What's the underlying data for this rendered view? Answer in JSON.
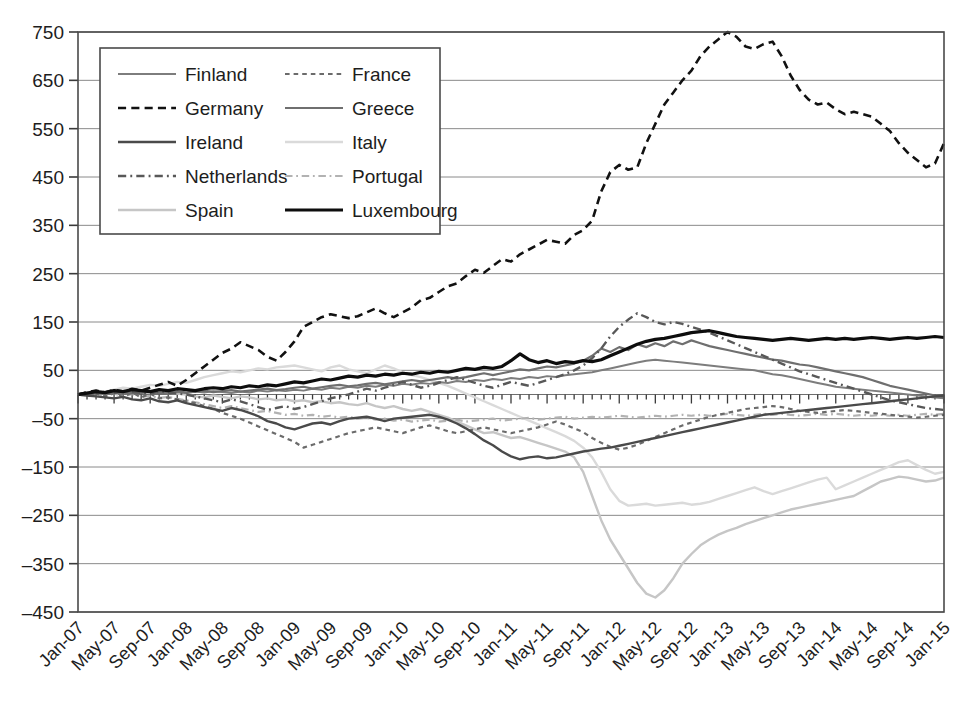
{
  "chart_data": {
    "type": "line",
    "title": "",
    "subtitle": "",
    "xlabel": "",
    "ylabel": "",
    "grid": true,
    "legend_position": "top-left-inside",
    "ylim": [
      -450,
      750
    ],
    "yticks": [
      750,
      650,
      550,
      450,
      350,
      250,
      150,
      50,
      -50,
      -150,
      -250,
      -350,
      -450
    ],
    "ytick_labels": [
      "750",
      "650",
      "550",
      "450",
      "350",
      "250",
      "150",
      "50",
      "–50",
      "–150",
      "–250",
      "–350",
      "–450"
    ],
    "x_tick_labels": [
      "Jan-07",
      "May-07",
      "Sep-07",
      "Jan-08",
      "May-08",
      "Sep-08",
      "Jan-09",
      "May-09",
      "Sep-09",
      "Jan-10",
      "May-10",
      "Sep-10",
      "Jan-11",
      "May-11",
      "Sep-11",
      "Jan-12",
      "May-12",
      "Sep-12",
      "Jan-13",
      "May-13",
      "Sep-13",
      "Jan-14",
      "May-14",
      "Sep-14",
      "Jan-15"
    ],
    "x_tick_step_months": 4,
    "x_range": [
      "Jan-07",
      "Jan-15"
    ],
    "x_points_count": 97,
    "series": [
      {
        "name": "Finland",
        "style": "solid",
        "color": "#7d7d7d",
        "width": 2.0,
        "values": [
          0,
          2,
          3,
          1,
          4,
          2,
          5,
          3,
          6,
          4,
          2,
          5,
          3,
          6,
          4,
          7,
          5,
          3,
          6,
          4,
          8,
          6,
          9,
          7,
          10,
          8,
          12,
          10,
          14,
          12,
          16,
          14,
          18,
          16,
          20,
          18,
          22,
          20,
          24,
          22,
          26,
          24,
          28,
          26,
          30,
          28,
          32,
          30,
          34,
          32,
          36,
          34,
          38,
          36,
          40,
          42,
          44,
          46,
          50,
          54,
          58,
          62,
          66,
          70,
          72,
          70,
          68,
          66,
          64,
          62,
          60,
          58,
          56,
          54,
          52,
          50,
          46,
          42,
          40,
          36,
          32,
          28,
          24,
          20,
          16,
          14,
          12,
          10,
          8,
          6,
          4,
          2,
          0,
          -2,
          -4,
          -6,
          -8
        ]
      },
      {
        "name": "Germany",
        "style": "dashed",
        "color": "#111111",
        "width": 2.6,
        "values": [
          0,
          5,
          8,
          4,
          10,
          6,
          12,
          8,
          14,
          20,
          26,
          18,
          30,
          44,
          58,
          72,
          86,
          95,
          108,
          100,
          92,
          78,
          70,
          88,
          110,
          140,
          150,
          160,
          166,
          162,
          158,
          162,
          170,
          178,
          168,
          160,
          170,
          180,
          195,
          200,
          212,
          224,
          230,
          245,
          258,
          252,
          266,
          280,
          275,
          290,
          300,
          310,
          320,
          316,
          312,
          330,
          340,
          360,
          420,
          460,
          475,
          465,
          470,
          520,
          560,
          600,
          625,
          650,
          670,
          700,
          720,
          735,
          750,
          740,
          720,
          715,
          725,
          730,
          700,
          660,
          630,
          610,
          600,
          604,
          590,
          580,
          585,
          580,
          575,
          560,
          545,
          520,
          500,
          485,
          470,
          478,
          520
        ]
      },
      {
        "name": "Ireland",
        "style": "solid",
        "color": "#4a4a4a",
        "width": 2.4,
        "values": [
          0,
          -2,
          -4,
          -6,
          -8,
          -5,
          -10,
          -12,
          -8,
          -14,
          -16,
          -12,
          -18,
          -22,
          -26,
          -30,
          -34,
          -28,
          -32,
          -38,
          -45,
          -55,
          -60,
          -68,
          -72,
          -66,
          -60,
          -58,
          -62,
          -55,
          -50,
          -48,
          -46,
          -50,
          -55,
          -50,
          -48,
          -46,
          -44,
          -42,
          -46,
          -52,
          -60,
          -70,
          -82,
          -95,
          -105,
          -118,
          -128,
          -134,
          -130,
          -128,
          -132,
          -130,
          -126,
          -122,
          -118,
          -115,
          -112,
          -110,
          -106,
          -102,
          -98,
          -94,
          -90,
          -86,
          -82,
          -78,
          -74,
          -70,
          -66,
          -62,
          -58,
          -54,
          -50,
          -46,
          -42,
          -40,
          -38,
          -36,
          -34,
          -32,
          -30,
          -28,
          -26,
          -24,
          -22,
          -20,
          -18,
          -16,
          -14,
          -12,
          -10,
          -8,
          -6,
          -4,
          -2
        ]
      },
      {
        "name": "Netherlands",
        "style": "dashdot",
        "color": "#585858",
        "width": 2.4,
        "values": [
          0,
          4,
          2,
          6,
          3,
          8,
          5,
          4,
          2,
          6,
          4,
          2,
          0,
          -4,
          -8,
          -12,
          -16,
          -10,
          -14,
          -20,
          -26,
          -32,
          -28,
          -24,
          -30,
          -26,
          -20,
          -14,
          -8,
          -4,
          0,
          6,
          12,
          8,
          14,
          20,
          26,
          20,
          14,
          18,
          24,
          30,
          36,
          30,
          24,
          18,
          14,
          20,
          26,
          22,
          18,
          24,
          30,
          36,
          42,
          50,
          60,
          75,
          95,
          120,
          140,
          155,
          168,
          160,
          150,
          145,
          150,
          146,
          140,
          134,
          128,
          120,
          112,
          104,
          96,
          88,
          80,
          72,
          64,
          56,
          48,
          42,
          36,
          30,
          24,
          18,
          12,
          6,
          0,
          -6,
          -12,
          -16,
          -20,
          -24,
          -28,
          -30,
          -32
        ]
      },
      {
        "name": "Spain",
        "style": "solid",
        "color": "#c6c6c6",
        "width": 2.4,
        "values": [
          0,
          3,
          5,
          2,
          6,
          4,
          8,
          5,
          3,
          6,
          4,
          2,
          0,
          -4,
          -6,
          -2,
          -5,
          -8,
          -4,
          -6,
          -10,
          -8,
          -12,
          -10,
          -14,
          -12,
          -16,
          -14,
          -18,
          -16,
          -20,
          -22,
          -18,
          -24,
          -28,
          -24,
          -30,
          -34,
          -30,
          -36,
          -42,
          -48,
          -56,
          -64,
          -72,
          -80,
          -78,
          -84,
          -90,
          -88,
          -94,
          -100,
          -106,
          -112,
          -118,
          -130,
          -160,
          -210,
          -260,
          -300,
          -330,
          -360,
          -390,
          -412,
          -420,
          -405,
          -380,
          -350,
          -330,
          -312,
          -300,
          -290,
          -282,
          -276,
          -268,
          -262,
          -256,
          -250,
          -244,
          -238,
          -234,
          -230,
          -226,
          -222,
          -218,
          -214,
          -210,
          -200,
          -190,
          -180,
          -175,
          -170,
          -172,
          -176,
          -180,
          -178,
          -172
        ]
      },
      {
        "name": "France",
        "style": "dotted-dash",
        "color": "#6b6b6b",
        "width": 2.2,
        "values": [
          0,
          -3,
          2,
          -4,
          3,
          -5,
          4,
          -6,
          2,
          -8,
          -6,
          -10,
          -14,
          -18,
          -24,
          -30,
          -38,
          -44,
          -50,
          -58,
          -66,
          -74,
          -82,
          -90,
          -98,
          -110,
          -104,
          -98,
          -92,
          -86,
          -80,
          -76,
          -72,
          -68,
          -72,
          -76,
          -80,
          -74,
          -68,
          -64,
          -70,
          -76,
          -80,
          -76,
          -72,
          -68,
          -72,
          -76,
          -80,
          -76,
          -72,
          -68,
          -62,
          -56,
          -62,
          -70,
          -78,
          -90,
          -100,
          -108,
          -114,
          -110,
          -104,
          -96,
          -88,
          -80,
          -72,
          -64,
          -58,
          -52,
          -46,
          -42,
          -38,
          -34,
          -30,
          -28,
          -26,
          -24,
          -26,
          -30,
          -34,
          -36,
          -38,
          -36,
          -34,
          -32,
          -34,
          -36,
          -38,
          -40,
          -42,
          -44,
          -46,
          -48,
          -46,
          -44,
          -42
        ]
      },
      {
        "name": "Greece",
        "style": "solid",
        "color": "#6f6f6f",
        "width": 2.2,
        "values": [
          0,
          2,
          4,
          1,
          3,
          5,
          2,
          4,
          6,
          3,
          5,
          7,
          4,
          6,
          8,
          5,
          7,
          9,
          6,
          8,
          10,
          12,
          9,
          11,
          14,
          16,
          12,
          15,
          18,
          20,
          17,
          19,
          22,
          24,
          21,
          24,
          27,
          30,
          27,
          30,
          33,
          36,
          33,
          36,
          40,
          44,
          40,
          44,
          48,
          52,
          50,
          54,
          58,
          56,
          60,
          64,
          70,
          80,
          95,
          88,
          98,
          92,
          104,
          98,
          106,
          100,
          110,
          104,
          112,
          106,
          100,
          96,
          92,
          88,
          84,
          80,
          76,
          72,
          70,
          66,
          62,
          60,
          56,
          52,
          48,
          44,
          40,
          36,
          30,
          24,
          18,
          14,
          10,
          6,
          2,
          -2,
          -6
        ]
      },
      {
        "name": "Italy",
        "style": "solid",
        "color": "#dadada",
        "width": 2.4,
        "values": [
          0,
          4,
          8,
          6,
          10,
          14,
          12,
          16,
          20,
          18,
          22,
          26,
          24,
          30,
          36,
          40,
          44,
          48,
          46,
          50,
          54,
          52,
          56,
          58,
          60,
          56,
          52,
          48,
          56,
          60,
          52,
          48,
          44,
          52,
          60,
          54,
          46,
          40,
          36,
          30,
          24,
          18,
          10,
          2,
          -6,
          -14,
          -22,
          -30,
          -38,
          -46,
          -54,
          -62,
          -70,
          -78,
          -86,
          -96,
          -110,
          -130,
          -160,
          -196,
          -220,
          -230,
          -228,
          -226,
          -230,
          -228,
          -226,
          -224,
          -228,
          -226,
          -222,
          -216,
          -210,
          -204,
          -198,
          -192,
          -200,
          -206,
          -200,
          -194,
          -188,
          -182,
          -176,
          -172,
          -196,
          -188,
          -180,
          -172,
          -164,
          -156,
          -148,
          -140,
          -136,
          -146,
          -156,
          -164,
          -160
        ]
      },
      {
        "name": "Portugal",
        "style": "dashdot",
        "color": "#b2b2b2",
        "width": 2.2,
        "values": [
          0,
          -2,
          1,
          -3,
          2,
          -4,
          1,
          -5,
          -3,
          -7,
          -5,
          -9,
          -12,
          -16,
          -20,
          -24,
          -28,
          -24,
          -28,
          -32,
          -36,
          -34,
          -38,
          -42,
          -40,
          -44,
          -42,
          -46,
          -44,
          -48,
          -46,
          -50,
          -48,
          -52,
          -50,
          -54,
          -52,
          -56,
          -54,
          -52,
          -56,
          -54,
          -52,
          -56,
          -54,
          -52,
          -50,
          -54,
          -52,
          -50,
          -48,
          -52,
          -50,
          -48,
          -46,
          -50,
          -48,
          -46,
          -48,
          -46,
          -44,
          -46,
          -48,
          -46,
          -44,
          -46,
          -44,
          -42,
          -44,
          -42,
          -44,
          -42,
          -40,
          -42,
          -44,
          -42,
          -40,
          -42,
          -40,
          -42,
          -44,
          -42,
          -40,
          -42,
          -40,
          -42,
          -44,
          -42,
          -44,
          -42,
          -44,
          -42,
          -44,
          -42,
          -40,
          -42,
          -40
        ]
      },
      {
        "name": "Luxembourg",
        "style": "solid",
        "color": "#0d0d0d",
        "width": 3.2,
        "values": [
          0,
          3,
          6,
          4,
          8,
          6,
          10,
          8,
          6,
          10,
          8,
          12,
          10,
          8,
          12,
          14,
          12,
          16,
          14,
          18,
          16,
          20,
          18,
          22,
          26,
          24,
          28,
          32,
          30,
          34,
          38,
          36,
          40,
          38,
          42,
          40,
          44,
          42,
          46,
          44,
          48,
          46,
          50,
          54,
          52,
          56,
          54,
          58,
          70,
          84,
          72,
          66,
          70,
          64,
          68,
          66,
          70,
          68,
          72,
          80,
          88,
          96,
          104,
          110,
          114,
          116,
          120,
          124,
          128,
          130,
          132,
          128,
          124,
          120,
          118,
          116,
          114,
          112,
          114,
          116,
          114,
          112,
          114,
          116,
          114,
          116,
          114,
          116,
          118,
          116,
          114,
          116,
          118,
          116,
          118,
          120,
          118
        ]
      }
    ]
  },
  "legend": {
    "entries": [
      {
        "label": "Finland",
        "style": "solid",
        "color": "#7d7d7d"
      },
      {
        "label": "France",
        "style": "dotted-dash",
        "color": "#6b6b6b"
      },
      {
        "label": "Germany",
        "style": "dashed",
        "color": "#111111"
      },
      {
        "label": "Greece",
        "style": "solid",
        "color": "#6f6f6f"
      },
      {
        "label": "Ireland",
        "style": "solid",
        "color": "#4a4a4a"
      },
      {
        "label": "Italy",
        "style": "solid",
        "color": "#dadada"
      },
      {
        "label": "Netherlands",
        "style": "dashdot",
        "color": "#585858"
      },
      {
        "label": "Portugal",
        "style": "dashdot",
        "color": "#b2b2b2"
      },
      {
        "label": "Spain",
        "style": "solid",
        "color": "#c6c6c6"
      },
      {
        "label": "Luxembourg",
        "style": "solid",
        "color": "#0d0d0d"
      }
    ]
  },
  "colors": {
    "background": "#ffffff",
    "grid": "#8a8a8a",
    "frame": "#4a4a4a",
    "text": "#1d1d1d"
  }
}
